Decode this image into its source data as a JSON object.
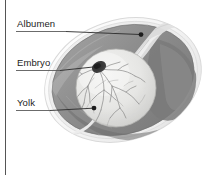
{
  "figure": {
    "background_color": "#ffffff",
    "border": {
      "side": "left",
      "color": "#555555",
      "width_px": 1
    },
    "labels": [
      {
        "id": "albumen",
        "text": "Albumen",
        "text_pos": {
          "x": 17,
          "y": 18
        },
        "underline": {
          "x1": 16,
          "y1": 31,
          "x2": 66,
          "y2": 31
        },
        "leader": {
          "x1": 16,
          "y1": 31.5,
          "x2": 140,
          "y2": 34.5
        },
        "dot": {
          "x": 141,
          "y": 34.5,
          "r": 2.4
        },
        "color": "#232323"
      },
      {
        "id": "embryo",
        "text": "Embryo",
        "text_pos": {
          "x": 17,
          "y": 57
        },
        "underline": {
          "x1": 16,
          "y1": 70,
          "x2": 60,
          "y2": 70
        },
        "leader": {
          "x1": 16,
          "y1": 70.5,
          "x2": 95,
          "y2": 66.5
        },
        "dot": {
          "x": 96,
          "y": 66.5,
          "r": 2.4
        },
        "color": "#232323"
      },
      {
        "id": "yolk",
        "text": "Yolk",
        "text_pos": {
          "x": 17,
          "y": 97
        },
        "underline": {
          "x1": 16,
          "y1": 110,
          "x2": 50,
          "y2": 110
        },
        "leader": {
          "x1": 16,
          "y1": 110.5,
          "x2": 93,
          "y2": 108
        },
        "dot": {
          "x": 94,
          "y": 108,
          "r": 2.4
        },
        "color": "#232323"
      }
    ],
    "structures": {
      "shell": {
        "name": "egg-shell",
        "color": "#fbfbfb",
        "outline": "#d8d8d8"
      },
      "shell_membrane": {
        "name": "shell-membrane",
        "color": "#e9e9e9"
      },
      "albumen": {
        "name": "albumen",
        "color": "#8e8e8e",
        "highlight": "#a8a8a8"
      },
      "albumen_dark": {
        "name": "albumen-dense-region",
        "color": "#7b7b7b"
      },
      "chalaza": {
        "name": "chalaza",
        "color": "#dedede"
      },
      "yolk": {
        "name": "yolk",
        "color": "#e4e4e2",
        "shadow": "#c9c9c7"
      },
      "embryo": {
        "name": "embryo-blastoderm",
        "color": "#3a3a3a"
      },
      "vessels": {
        "name": "blood-vessels",
        "color": "#6f6f6f"
      }
    },
    "egg_geometry": {
      "center": {
        "x": 123,
        "y": 80
      },
      "radius_x": 80,
      "radius_y": 60,
      "rotation_deg": -18
    },
    "yolk_geometry": {
      "center": {
        "x": 116,
        "y": 88
      },
      "radius_x": 40,
      "radius_y": 39
    }
  }
}
